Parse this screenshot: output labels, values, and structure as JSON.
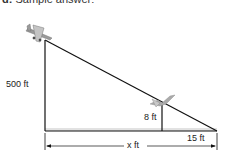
{
  "header": {
    "prefix": "d:",
    "text": "Sample answer:"
  },
  "diagram": {
    "type": "similar-triangles",
    "labels": {
      "tall_height": "500 ft",
      "short_height": "8 ft",
      "short_base": "15 ft",
      "total_base": "x ft"
    },
    "objects": {
      "top_figure": "airplane",
      "small_figure": "bird"
    },
    "colors": {
      "line": "#111111",
      "ground_shade": "#d8d8d8",
      "figure": "#b0b0b0"
    }
  }
}
